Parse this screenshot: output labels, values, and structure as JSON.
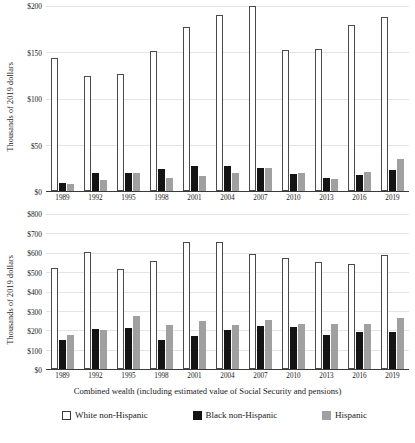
{
  "chart_data": [
    {
      "type": "bar",
      "panel": "top",
      "title": "",
      "xlabel": "",
      "ylabel": "Thousands of 2019 dollars",
      "categories": [
        "1989",
        "1992",
        "1995",
        "1998",
        "2001",
        "2004",
        "2007",
        "2010",
        "2013",
        "2016",
        "2019"
      ],
      "ylim": [
        0,
        200
      ],
      "yticks": [
        "$0",
        "$50",
        "$100",
        "$150",
        "$200"
      ],
      "ytick_values": [
        0,
        50,
        100,
        150,
        200
      ],
      "grid": true,
      "legend_position": "bottom",
      "series": [
        {
          "name": "White non-Hispanic",
          "color": "#ffffff",
          "values": [
            144,
            124,
            127,
            151,
            177,
            190,
            200,
            152,
            154,
            180,
            188
          ]
        },
        {
          "name": "Black non-Hispanic",
          "color": "#141414",
          "values": [
            9,
            19,
            19,
            24,
            27,
            27,
            25,
            18,
            14,
            17,
            23
          ]
        },
        {
          "name": "Hispanic",
          "color": "#a0a0a0",
          "values": [
            8,
            12,
            20,
            14,
            16,
            19,
            25,
            19,
            13,
            21,
            35
          ]
        }
      ]
    },
    {
      "type": "bar",
      "panel": "bottom",
      "title": "",
      "xlabel": "Combined wealth (including estimated value of Social Security and pensions)",
      "ylabel": "Thousands of 2019 dollars",
      "categories": [
        "1989",
        "1992",
        "1995",
        "1998",
        "2001",
        "2004",
        "2007",
        "2010",
        "2013",
        "2016",
        "2019"
      ],
      "ylim": [
        0,
        800
      ],
      "yticks": [
        "$0",
        "$100",
        "$200",
        "$300",
        "$400",
        "$500",
        "$600",
        "$700",
        "$800"
      ],
      "ytick_values": [
        0,
        100,
        200,
        300,
        400,
        500,
        600,
        700,
        800
      ],
      "grid": true,
      "legend_position": "bottom",
      "series": [
        {
          "name": "White non-Hispanic",
          "color": "#ffffff",
          "values": [
            523,
            602,
            516,
            556,
            657,
            657,
            592,
            572,
            552,
            543,
            588
          ]
        },
        {
          "name": "Black non-Hispanic",
          "color": "#141414",
          "values": [
            152,
            206,
            214,
            150,
            168,
            203,
            220,
            219,
            173,
            191,
            192
          ]
        },
        {
          "name": "Hispanic",
          "color": "#a0a0a0",
          "values": [
            176,
            203,
            276,
            228,
            247,
            226,
            253,
            234,
            234,
            232,
            262
          ]
        }
      ]
    }
  ],
  "legend": {
    "items": [
      {
        "label": "White non-Hispanic",
        "swatch": "white"
      },
      {
        "label": "Black non-Hispanic",
        "swatch": "black"
      },
      {
        "label": "Hispanic",
        "swatch": "gray"
      }
    ]
  },
  "xaxis_title": "Combined wealth (including estimated value of Social Security and pensions)"
}
